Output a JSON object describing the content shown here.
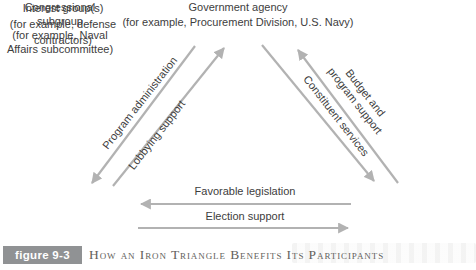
{
  "figure": {
    "badge_label": "figure 9-3",
    "caption": "How an Iron Triangle Benefits Its Participants"
  },
  "nodes": {
    "government_agency": {
      "lines": [
        "Government agency",
        "(for example, Procurement Division, U.S. Navy)"
      ]
    },
    "interest_group": {
      "lines": [
        "Interest group(s)",
        "(for example, defense",
        "contractors)"
      ]
    },
    "congressional_subgroup": {
      "lines": [
        "Congressional",
        "subgroup",
        "(for example, Naval",
        "Affairs subcommittee)"
      ]
    }
  },
  "edges": {
    "program_administration": {
      "label": "Program administration",
      "arrow_points_to": "interest-group"
    },
    "lobbying_support": {
      "label": "Lobbying support",
      "arrow_points_to": "government-agency"
    },
    "constituent_services": {
      "label": "Constituent services",
      "arrow_points_to": "congressional-subgroup"
    },
    "budget_program_support": {
      "lines": [
        "Budget and",
        "program support"
      ],
      "arrow_points_to": "government-agency"
    },
    "favorable_legislation": {
      "label": "Favorable legislation",
      "arrow_points_to": "interest-group"
    },
    "election_support": {
      "label": "Election support",
      "arrow_points_to": "congressional-subgroup"
    }
  },
  "colors": {
    "arrow": "#b2b2b2",
    "text": "#3d3d3d",
    "badge_bg": "#909294",
    "badge_text": "#ffffff",
    "caption_text": "#63625c"
  }
}
